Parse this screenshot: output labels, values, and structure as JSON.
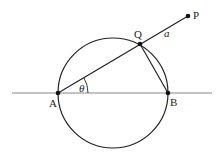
{
  "diagram": {
    "points": [
      {
        "id": "A",
        "label": "A",
        "x": 58,
        "y": 93,
        "label_x": 49,
        "label_y": 107
      },
      {
        "id": "B",
        "label": "B",
        "x": 168,
        "y": 93,
        "label_x": 170,
        "label_y": 106
      },
      {
        "id": "Q",
        "label": "Q",
        "x": 140,
        "y": 44,
        "label_x": 134,
        "label_y": 38
      },
      {
        "id": "P",
        "label": "P",
        "x": 188,
        "y": 16,
        "label_x": 193,
        "label_y": 19
      }
    ],
    "circle": {
      "cx": 113,
      "cy": 93,
      "r": 55
    },
    "baseline": {
      "x1": 12,
      "y1": 93,
      "x2": 212,
      "y2": 93
    },
    "segments": [
      {
        "from": "A",
        "to": "P"
      },
      {
        "from": "Q",
        "to": "B"
      }
    ],
    "angle": {
      "label": "θ",
      "vertex": "A",
      "label_x": 79,
      "label_y": 92
    },
    "length_label": {
      "label": "a",
      "x": 164,
      "y": 37
    },
    "colors": {
      "stroke": "#222222",
      "baseline": "#888888",
      "point": "#111111"
    }
  }
}
